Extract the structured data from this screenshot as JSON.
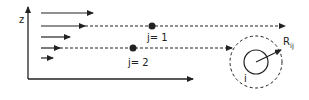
{
  "diagram": {
    "axis_label": "z",
    "particle_labels": {
      "j1": "j= 1",
      "j2": "j= 2",
      "i": "i"
    },
    "radius_label": {
      "main": "R",
      "sub": "ij"
    },
    "colors": {
      "stroke": "#222222",
      "background": "#ffffff"
    },
    "flow_arrows": [
      {
        "y": 13,
        "x1": 41,
        "x2": 93
      },
      {
        "y": 26,
        "x1": 41,
        "x2": 85
      },
      {
        "y": 37,
        "x1": 41,
        "x2": 70
      },
      {
        "y": 48,
        "x1": 41,
        "x2": 60
      },
      {
        "y": 58,
        "x1": 41,
        "x2": 53
      }
    ],
    "trajectories": [
      {
        "name": "j1",
        "y": 26,
        "x_start": 85,
        "x_end": 285,
        "dot_x": 152
      },
      {
        "name": "j2",
        "y": 48,
        "x_start": 60,
        "x_end": 232,
        "dot_x": 133
      }
    ],
    "interaction_zone": {
      "cx": 256,
      "cy": 62,
      "r_outer": 26,
      "r_inner": 12
    }
  }
}
